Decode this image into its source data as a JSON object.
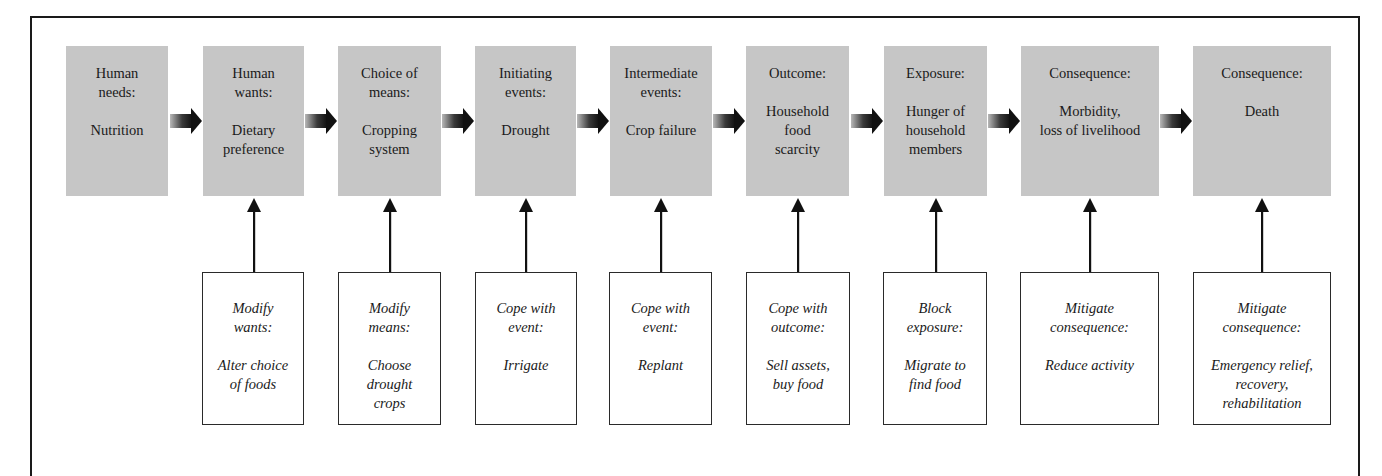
{
  "diagram": {
    "colors": {
      "stage_fill": "#c6c6c6",
      "response_fill": "#ffffff",
      "border": "#1a1a1a",
      "arrow": "#111111"
    },
    "stages": [
      {
        "head": [
          "Human",
          "needs:"
        ],
        "body": [
          "Nutrition"
        ],
        "x": 66,
        "w": 102
      },
      {
        "head": [
          "Human",
          "wants:"
        ],
        "body": [
          "Dietary",
          "preference"
        ],
        "x": 203,
        "w": 101
      },
      {
        "head": [
          "Choice of",
          "means:"
        ],
        "body": [
          "Cropping",
          "system"
        ],
        "x": 338,
        "w": 103
      },
      {
        "head": [
          "Initiating",
          "events:"
        ],
        "body": [
          "Drought"
        ],
        "x": 475,
        "w": 101
      },
      {
        "head": [
          "Intermediate",
          "events:"
        ],
        "body": [
          "Crop failure"
        ],
        "x": 610,
        "w": 102
      },
      {
        "head": [
          "Outcome:"
        ],
        "body": [
          "Household",
          "food",
          "scarcity"
        ],
        "x": 746,
        "w": 103
      },
      {
        "head": [
          "Exposure:"
        ],
        "body": [
          "Hunger of",
          "household",
          "members"
        ],
        "x": 884,
        "w": 103
      },
      {
        "head": [
          "Consequence:"
        ],
        "body": [
          "Morbidity,",
          "loss of livelihood"
        ],
        "x": 1021,
        "w": 138
      },
      {
        "head": [
          "Consequence:"
        ],
        "body": [
          "Death"
        ],
        "x": 1193,
        "w": 138
      }
    ],
    "responses": [
      {
        "stage_index": 1,
        "head": [
          "Modify",
          "wants:"
        ],
        "body": [
          "Alter choice",
          "of foods"
        ],
        "x": 202,
        "w": 102
      },
      {
        "stage_index": 2,
        "head": [
          "Modify",
          "means:"
        ],
        "body": [
          "Choose",
          "drought",
          "crops"
        ],
        "x": 338,
        "w": 103
      },
      {
        "stage_index": 3,
        "head": [
          "Cope with",
          "event:"
        ],
        "body": [
          "Irrigate"
        ],
        "x": 475,
        "w": 102
      },
      {
        "stage_index": 4,
        "head": [
          "Cope with",
          "event:"
        ],
        "body": [
          "Replant"
        ],
        "x": 609,
        "w": 103
      },
      {
        "stage_index": 5,
        "head": [
          "Cope with",
          "outcome:"
        ],
        "body": [
          "Sell assets,",
          "buy food"
        ],
        "x": 746,
        "w": 104
      },
      {
        "stage_index": 6,
        "head": [
          "Block",
          "exposure:"
        ],
        "body": [
          "Migrate to",
          "find food"
        ],
        "x": 883,
        "w": 104
      },
      {
        "stage_index": 7,
        "head": [
          "Mitigate",
          "consequence:"
        ],
        "body": [
          "Reduce activity"
        ],
        "x": 1020,
        "w": 139
      },
      {
        "stage_index": 8,
        "head": [
          "Mitigate",
          "consequence:"
        ],
        "body": [
          "Emergency relief,",
          "recovery,",
          "rehabilitation"
        ],
        "x": 1193,
        "w": 138
      }
    ]
  }
}
